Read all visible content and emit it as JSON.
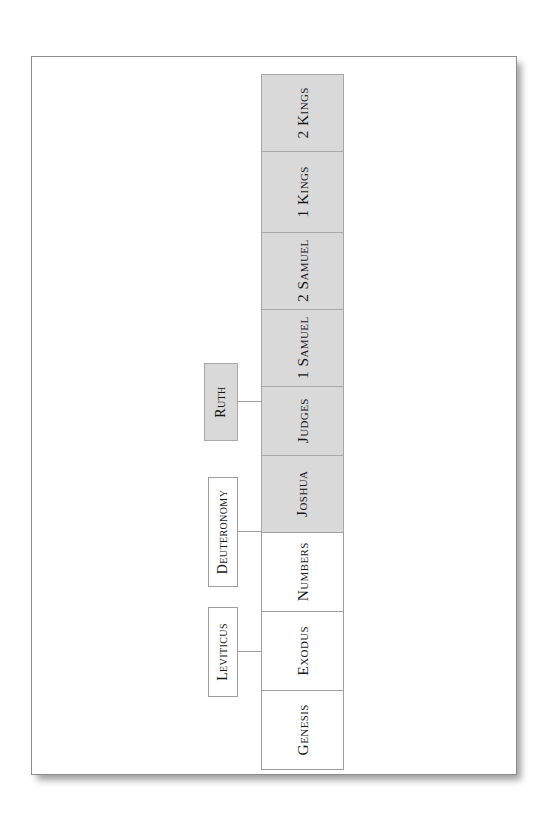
{
  "document": {
    "kind": "printed-page-diagram",
    "title": "Old Testament Historical Books Chain Diagram",
    "page_background": "#ffffff",
    "sheet_border_color": "#8c8c8c"
  },
  "diagram": {
    "type": "flow-chain",
    "orientation": "vertical",
    "text_rotation_degrees": -90,
    "colors": {
      "shaded_box_fill": "#d9d9d9",
      "plain_box_fill": "#ffffff",
      "box_border": "#9d9d9d",
      "connector_line": "#a0a0a0",
      "label_text": "#17171a"
    },
    "main_chain": [
      {
        "label": "2 Kings",
        "shaded": true,
        "height": 78
      },
      {
        "label": "1 Kings",
        "shaded": true,
        "height": 82
      },
      {
        "label": "2 Samuel",
        "shaded": true,
        "height": 78
      },
      {
        "label": "1 Samuel",
        "shaded": true,
        "height": 78
      },
      {
        "label": "Judges",
        "shaded": true,
        "height": 70
      },
      {
        "label": "Joshua",
        "shaded": true,
        "height": 78
      },
      {
        "label": "Numbers",
        "shaded": false,
        "height": 80
      },
      {
        "label": "Exodus",
        "shaded": false,
        "height": 80
      },
      {
        "label": "Genesis",
        "shaded": false,
        "height": 80
      }
    ],
    "branch_boxes": [
      {
        "label": "Ruth",
        "shaded": true,
        "connects_to": "Judges"
      },
      {
        "label": "Deuteronomy",
        "shaded": false,
        "connects_to": "Numbers"
      },
      {
        "label": "Leviticus",
        "shaded": false,
        "connects_to": "Exodus"
      }
    ]
  }
}
